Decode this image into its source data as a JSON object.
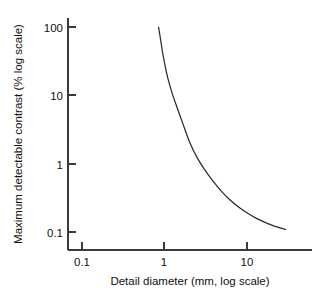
{
  "chart_data": {
    "type": "line",
    "title": "",
    "xlabel": "Detail diameter (mm, log scale)",
    "ylabel": "Maximum detectable contrast (% log scale)",
    "xscale": "log",
    "yscale": "log",
    "xlim": [
      0.063,
      41
    ],
    "ylim": [
      0.072,
      220
    ],
    "grid": false,
    "legend": "none",
    "xticks": [
      0.1,
      1,
      10
    ],
    "xtick_labels": [
      "0.1",
      "1",
      "10"
    ],
    "yticks": [
      0.1,
      1,
      10,
      100
    ],
    "ytick_labels": [
      "0.1",
      "1",
      "10",
      "100"
    ],
    "series": [
      {
        "name": "maximum detectable contrast",
        "x": [
          0.86,
          0.9,
          0.95,
          1.0,
          1.1,
          1.25,
          1.45,
          1.7,
          2.05,
          2.5,
          3.1,
          3.9,
          4.9,
          6.2,
          7.9,
          10.2,
          13.0,
          16.5,
          21.0,
          25.0,
          29.0
        ],
        "y": [
          100,
          72,
          47,
          33,
          19,
          11.0,
          6.5,
          3.8,
          2.05,
          1.25,
          0.82,
          0.56,
          0.4,
          0.3,
          0.235,
          0.19,
          0.16,
          0.14,
          0.124,
          0.116,
          0.11
        ]
      }
    ]
  },
  "axes": {
    "x_title": "Detail diameter (mm, log scale)",
    "y_title": "Maximum detectable contrast (% log scale)"
  }
}
